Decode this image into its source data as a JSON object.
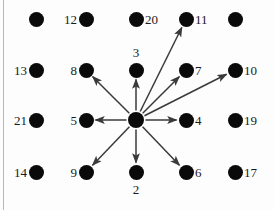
{
  "figure": {
    "width": 274,
    "height": 210,
    "background_color": "#fdfdfd",
    "node_color": "#0a0a0a",
    "edge_color": "#3a3a3a",
    "label_color": "#1a1a1a",
    "rule_color": "#b9b9b9"
  },
  "grid": {
    "columns_x": [
      36,
      86,
      136,
      186,
      235
    ],
    "rows_y": [
      19,
      70,
      120,
      172
    ]
  },
  "hub": {
    "id": "center",
    "label": "",
    "x": 136,
    "y": 120,
    "radius": 8
  },
  "nodes": [
    {
      "id": "n-r1c1",
      "label": "",
      "x": 36,
      "y": 19,
      "label_pos": "none"
    },
    {
      "id": "n-12",
      "label": "12",
      "x": 86,
      "y": 19,
      "label_pos": "left"
    },
    {
      "id": "n-20",
      "label": "20",
      "x": 136,
      "y": 19,
      "label_pos": "right"
    },
    {
      "id": "n-11",
      "label": "11",
      "x": 186,
      "y": 19,
      "label_pos": "right"
    },
    {
      "id": "n-r1c5",
      "label": "",
      "x": 235,
      "y": 19,
      "label_pos": "none"
    },
    {
      "id": "n-13",
      "label": "13",
      "x": 36,
      "y": 70,
      "label_pos": "left"
    },
    {
      "id": "n-8",
      "label": "8",
      "x": 86,
      "y": 70,
      "label_pos": "left"
    },
    {
      "id": "n-3",
      "label": "3",
      "x": 136,
      "y": 70,
      "label_pos": "above"
    },
    {
      "id": "n-7",
      "label": "7",
      "x": 186,
      "y": 70,
      "label_pos": "right"
    },
    {
      "id": "n-10",
      "label": "10",
      "x": 235,
      "y": 70,
      "label_pos": "right"
    },
    {
      "id": "n-21",
      "label": "21",
      "x": 36,
      "y": 120,
      "label_pos": "left"
    },
    {
      "id": "n-5",
      "label": "5",
      "x": 86,
      "y": 120,
      "label_pos": "left"
    },
    {
      "id": "n-4",
      "label": "4",
      "x": 186,
      "y": 120,
      "label_pos": "right"
    },
    {
      "id": "n-19",
      "label": "19",
      "x": 235,
      "y": 120,
      "label_pos": "right"
    },
    {
      "id": "n-14",
      "label": "14",
      "x": 36,
      "y": 172,
      "label_pos": "left"
    },
    {
      "id": "n-9",
      "label": "9",
      "x": 86,
      "y": 172,
      "label_pos": "left"
    },
    {
      "id": "n-2",
      "label": "2",
      "x": 136,
      "y": 172,
      "label_pos": "below"
    },
    {
      "id": "n-6",
      "label": "6",
      "x": 186,
      "y": 172,
      "label_pos": "right"
    },
    {
      "id": "n-17",
      "label": "17",
      "x": 235,
      "y": 172,
      "label_pos": "right"
    }
  ],
  "edges": [
    {
      "id": "edge-center-3",
      "from": "center",
      "to": "n-3",
      "to_label": "3",
      "direction": "up"
    },
    {
      "id": "edge-center-11",
      "from": "center",
      "to": "n-11",
      "to_label": "11",
      "direction": "up-right-steep"
    },
    {
      "id": "edge-center-7",
      "from": "center",
      "to": "n-7",
      "to_label": "7",
      "direction": "up-right"
    },
    {
      "id": "edge-center-10",
      "from": "center",
      "to": "n-10",
      "to_label": "10",
      "direction": "right-up-shallow"
    },
    {
      "id": "edge-center-4",
      "from": "center",
      "to": "n-4",
      "to_label": "4",
      "direction": "right"
    },
    {
      "id": "edge-center-6",
      "from": "center",
      "to": "n-6",
      "to_label": "6",
      "direction": "down-right"
    },
    {
      "id": "edge-center-2",
      "from": "center",
      "to": "n-2",
      "to_label": "2",
      "direction": "down"
    },
    {
      "id": "edge-center-9",
      "from": "center",
      "to": "n-9",
      "to_label": "9",
      "direction": "down-left"
    },
    {
      "id": "edge-center-5",
      "from": "center",
      "to": "n-5",
      "to_label": "5",
      "direction": "left"
    },
    {
      "id": "edge-center-8",
      "from": "center",
      "to": "n-8",
      "to_label": "8",
      "direction": "up-left"
    }
  ]
}
